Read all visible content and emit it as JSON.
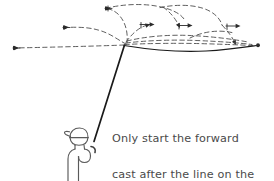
{
  "illustration": {
    "title": "fly-casting-back-cast-diagram",
    "style": "hand-drawn line illustration",
    "colors": {
      "ink": "#1a1a1a",
      "dashed_line": "#555555",
      "text": "#4a4a4a",
      "background": "#ffffff"
    },
    "figure": {
      "label": "angler-stick-figure",
      "description": "side view of a person wearing a cap holding a fly rod"
    },
    "rod": {
      "label": "fly-rod",
      "tip": [
        124,
        45
      ],
      "grip": [
        94,
        141
      ]
    },
    "fly_line_solid": {
      "label": "line-on-water",
      "description": "solid line extending to the right from the rod tip",
      "end_point": [
        258,
        45
      ]
    },
    "back_cast_paths": {
      "label": "dashed-line-trajectories",
      "description": "dashed loops showing the fly line unrolling on the back cast",
      "arrow_count": 8
    }
  },
  "caption": {
    "name": "instruction-caption",
    "full_text": "Only start the forward cast after the line on the back cast has flattened out.",
    "lines": [
      "Only start the forward",
      "cast after the line on the",
      "back cast has flattened out."
    ],
    "line1": "Only start the forward",
    "line2": "cast after the line on the",
    "line3": "back cast has flattened out."
  }
}
